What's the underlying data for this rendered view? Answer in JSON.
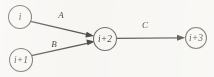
{
  "diagram": {
    "type": "directed-graph",
    "background_color": "#f7f6f3",
    "node_stroke_color": "#6d6a66",
    "edge_color": "#595653",
    "text_color": "#3f3d3a",
    "nodes": [
      {
        "id": "n1",
        "label": "i",
        "cx": 20,
        "cy": 17,
        "r": 11.5
      },
      {
        "id": "n2",
        "label": "i+1",
        "cx": 21,
        "cy": 60,
        "r": 11.5
      },
      {
        "id": "n3",
        "label": "i+2",
        "cx": 105,
        "cy": 39,
        "r": 11.5
      },
      {
        "id": "n4",
        "label": "i+3",
        "cx": 196,
        "cy": 38,
        "r": 10.5
      }
    ],
    "edges": [
      {
        "id": "e1",
        "label": "A",
        "from": "n1",
        "to": "n3",
        "label_x": 61,
        "label_y": 16
      },
      {
        "id": "e2",
        "label": "B",
        "from": "n2",
        "to": "n3",
        "label_x": 54,
        "label_y": 45
      },
      {
        "id": "e3",
        "label": "C",
        "from": "n3",
        "to": "n4",
        "label_x": 145,
        "label_y": 26
      }
    ]
  }
}
